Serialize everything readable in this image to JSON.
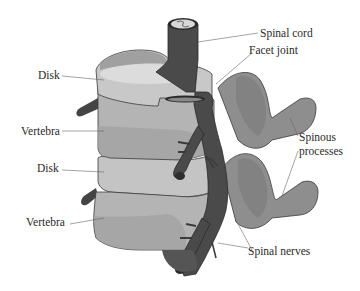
{
  "figure": {
    "type": "anatomical-diagram",
    "labels": {
      "spinal_cord": "Spinal cord",
      "facet_joint": "Facet joint",
      "disk_upper": "Disk",
      "vertebra_upper": "Vertebra",
      "spinous_processes_line1": "Spinous",
      "spinous_processes_line2": "processes",
      "disk_lower": "Disk",
      "vertebra_lower": "Vertebra",
      "spinal_nerves": "Spinal nerves"
    },
    "colors": {
      "background": "#ffffff",
      "vertebra_body": "#b4b4b4",
      "vertebra_shadow": "#9a9a9a",
      "disk": "#c8c8c8",
      "disk_highlight": "#dcdcdc",
      "spinal_cord": "#4a4a4a",
      "nerve": "#555555",
      "spinous_process": "#8e8e8e",
      "spinous_process_dark": "#7a7a7a",
      "outline": "#3a3a3a",
      "leader_line": "#666666",
      "text": "#2a2a2a"
    }
  }
}
